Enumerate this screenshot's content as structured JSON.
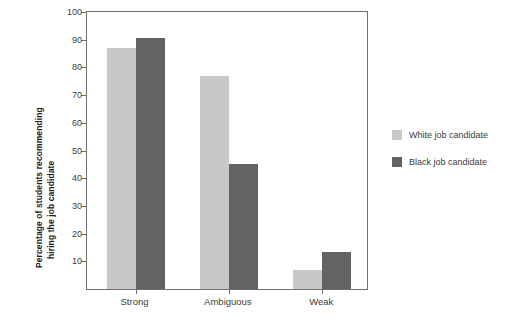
{
  "chart_data": {
    "type": "bar",
    "title": "",
    "subtitle": "",
    "xlabel": "",
    "ylabel": "Percentage of students recommending hiring the job candidate",
    "ylabel_lines": [
      "Percentage of students recommending",
      "hiring the job candidate"
    ],
    "categories": [
      "Strong",
      "Ambiguous",
      "Weak"
    ],
    "series": [
      {
        "name": "White job candidate",
        "values": [
          87,
          77,
          7
        ],
        "color": "#c8c8c8"
      },
      {
        "name": "Black job candidate",
        "values": [
          90.5,
          45,
          13.5
        ],
        "color": "#636363"
      }
    ],
    "ylim": [
      0,
      100
    ],
    "yticks": [
      100,
      90,
      80,
      70,
      60,
      50,
      40,
      30,
      20,
      10
    ],
    "ytick_labels": [
      "100",
      "90",
      "80",
      "70",
      "60",
      "50",
      "40",
      "30",
      "20",
      "10"
    ],
    "grid": false,
    "legend_position": "right"
  },
  "legend": {
    "items": [
      {
        "label": "White job candidate",
        "color": "#c8c8c8"
      },
      {
        "label": "Black job candidate",
        "color": "#636363"
      }
    ]
  },
  "axis": {
    "line_color": "#6e6e6e",
    "text_color": "#3b3b3b"
  }
}
